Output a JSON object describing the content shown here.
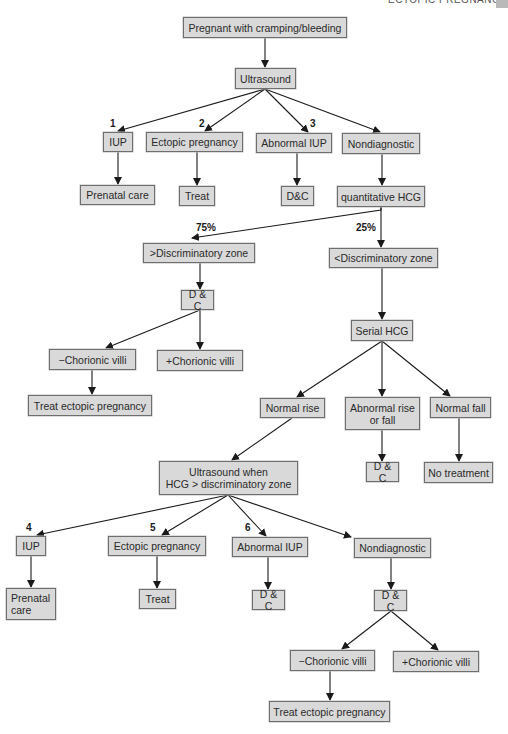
{
  "header": {
    "running_title": "ECTOPIC PREGNANCY"
  },
  "nodes": {
    "start": "Pregnant with cramping/bleeding",
    "us1": "Ultrasound",
    "iup1": "IUP",
    "ectopic1": "Ectopic pregnancy",
    "abn_iup1": "Abnormal IUP",
    "nondiag1": "Nondiagnostic",
    "prenatal1": "Prenatal care",
    "treat1": "Treat",
    "dc1": "D&C",
    "qhcg": "quantitative HCG",
    "gt_dz": ">Discriminatory zone",
    "lt_dz": "<Discriminatory zone",
    "dc2": "D & C",
    "neg_cv1": "−Chorionic villi",
    "pos_cv1": "+Chorionic villi",
    "treat_ectopic1": "Treat ectopic pregnancy",
    "serial_hcg": "Serial HCG",
    "normal_rise": "Normal rise",
    "abn_rise_fall": "Abnormal rise\nor fall",
    "normal_fall": "Normal fall",
    "dc3": "D & C",
    "no_treatment": "No treatment",
    "us2": "Ultrasound when\nHCG > discriminatory zone",
    "iup2": "IUP",
    "ectopic2": "Ectopic pregnancy",
    "abn_iup2": "Abnormal IUP",
    "nondiag2": "Nondiagnostic",
    "prenatal2": "Prenatal\ncare",
    "treat2": "Treat",
    "dc4": "D & C",
    "dc5": "D & C",
    "neg_cv2": "−Chorionic villi",
    "pos_cv2": "+Chorionic villi",
    "treat_ectopic2": "Treat ectopic pregnancy"
  },
  "labels": {
    "n1": "1",
    "n2": "2",
    "n3": "3",
    "n4": "4",
    "n5": "5",
    "n6": "6",
    "pct75": "75%",
    "pct25": "25%"
  },
  "colors": {
    "node_fill": "#d9d9d9",
    "node_border": "#6e6e6e",
    "arrow": "#1a1a1a"
  }
}
